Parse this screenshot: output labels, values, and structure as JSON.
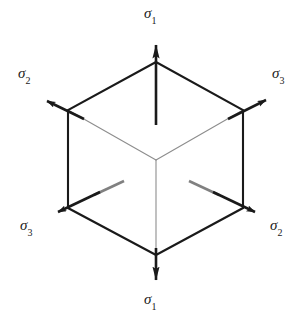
{
  "figure": {
    "background_color": "#ffffff",
    "stroke_color": "#1a1a1a",
    "hidden_edge_color": "#8a8a8a",
    "width": 308,
    "height": 324
  },
  "labels": [
    {
      "id": "sigma1-top",
      "symbol": "σ",
      "subscript": "1",
      "text": "σ1",
      "position": "top",
      "x": 156,
      "y": 14
    },
    {
      "id": "sigma2-upper-left",
      "symbol": "σ",
      "subscript": "2",
      "text": "σ2",
      "position": "upper-left",
      "x": 28,
      "y": 74
    },
    {
      "id": "sigma3-upper-right",
      "symbol": "σ",
      "subscript": "3",
      "text": "σ3",
      "position": "upper-right",
      "x": 282,
      "y": 74
    },
    {
      "id": "sigma3-lower-left",
      "symbol": "σ",
      "subscript": "3",
      "text": "σ3",
      "position": "lower-left",
      "x": 30,
      "y": 226
    },
    {
      "id": "sigma2-lower-right",
      "symbol": "σ",
      "subscript": "2",
      "text": "σ2",
      "position": "lower-right",
      "x": 280,
      "y": 226
    },
    {
      "id": "sigma1-bottom",
      "symbol": "σ",
      "subscript": "1",
      "text": "σ1",
      "position": "bottom",
      "x": 156,
      "y": 300
    }
  ],
  "cube": {
    "description": "Isometric cube drawn as a hexagon outline with three interior edges meeting at the front corner",
    "vertices": {
      "top": [
        156,
        62
      ],
      "upper_left": [
        68,
        110
      ],
      "upper_right": [
        243,
        110
      ],
      "lower_left": [
        68,
        208
      ],
      "lower_right": [
        243,
        208
      ],
      "bottom": [
        156,
        255
      ],
      "center_front": [
        156,
        160
      ]
    },
    "outline_path": "M 156 62 L 68 110 L 68 208 L 156 255 L 243 208 L 243 110 Z",
    "interior_edges": [
      "M 156 160 L 68 110",
      "M 156 160 L 243 110",
      "M 156 160 L 156 255"
    ]
  },
  "arrows": [
    {
      "id": "arrow-sigma1-top",
      "label": "σ1",
      "style": "solid",
      "from": [
        156,
        125
      ],
      "to": [
        156,
        32
      ],
      "direction": "up"
    },
    {
      "id": "arrow-sigma1-bottom",
      "label": "σ1",
      "style": "solid",
      "from": [
        156,
        248
      ],
      "to": [
        156,
        289
      ],
      "direction": "down"
    },
    {
      "id": "arrow-sigma2-upper-left",
      "label": "σ2",
      "style": "solid",
      "from": [
        82,
        118
      ],
      "to": [
        37,
        96
      ],
      "direction": "up-left"
    },
    {
      "id": "arrow-sigma3-upper-right",
      "label": "σ3",
      "style": "solid",
      "from": [
        230,
        118
      ],
      "to": [
        275,
        95
      ],
      "direction": "up-right"
    },
    {
      "id": "arrow-sigma3-lower-left",
      "label": "σ3",
      "style": "dashed-tail",
      "from": [
        124,
        181
      ],
      "to": [
        49,
        216
      ],
      "direction": "down-left"
    },
    {
      "id": "arrow-sigma2-lower-right",
      "label": "σ2",
      "style": "dashed-tail",
      "from": [
        189,
        181
      ],
      "to": [
        263,
        216
      ],
      "direction": "down-right"
    }
  ]
}
